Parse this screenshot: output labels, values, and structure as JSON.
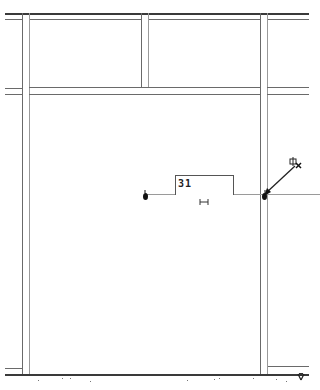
{
  "drawing": {
    "type": "cad-wall-layout",
    "dimension": {
      "value": "31",
      "label_box": {
        "x": 175,
        "y": 175,
        "w": 58,
        "h": 19
      }
    },
    "colors": {
      "line_dark": "#3a3a3a",
      "line_mid": "#6a6a6a",
      "line_light": "#9a9a9a",
      "background": "#ffffff"
    },
    "icons": {
      "cursor": "cad-cursor-icon",
      "snap_point": "endpoint-snap-icon",
      "dimension_marker": "dimension-span-icon"
    }
  }
}
